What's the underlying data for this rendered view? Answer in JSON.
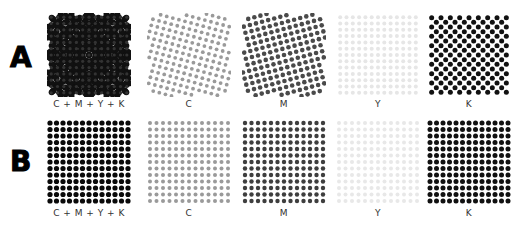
{
  "rows": [
    {
      "label": "A",
      "description": "rotated screen angles (rosette)",
      "panels": [
        {
          "caption": "C + M + Y + K",
          "type": "combined",
          "angle": 0
        },
        {
          "caption": "C",
          "type": "single",
          "angle": 15,
          "color": "#9a9a9a",
          "dot": 1.9
        },
        {
          "caption": "M",
          "type": "single",
          "angle": 75,
          "color": "#4a4a4a",
          "dot": 2.3
        },
        {
          "caption": "Y",
          "type": "single",
          "angle": 0,
          "color": "#e6e6e6",
          "dot": 2.0
        },
        {
          "caption": "K",
          "type": "single",
          "angle": 45,
          "color": "#111111",
          "dot": 2.5
        }
      ]
    },
    {
      "label": "B",
      "description": "same screen angle (aligned)",
      "panels": [
        {
          "caption": "C + M + Y + K",
          "type": "combined-aligned",
          "angle": 0,
          "color": "#0a0a0a",
          "dot": 2.6
        },
        {
          "caption": "C",
          "type": "single",
          "angle": 0,
          "color": "#9a9a9a",
          "dot": 2.0
        },
        {
          "caption": "M",
          "type": "single",
          "angle": 0,
          "color": "#3e3e3e",
          "dot": 2.2
        },
        {
          "caption": "Y",
          "type": "single",
          "angle": 0,
          "color": "#e8e8e8",
          "dot": 2.0
        },
        {
          "caption": "K",
          "type": "single",
          "angle": 0,
          "color": "#111111",
          "dot": 2.5
        }
      ]
    }
  ]
}
